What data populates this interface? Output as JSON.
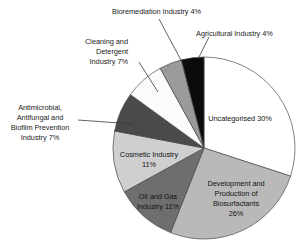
{
  "chart_data": {
    "type": "pie",
    "title": "",
    "subtitle": "",
    "xlabel": "",
    "ylabel": "",
    "legend_position": "none",
    "grid": false,
    "units": "percent",
    "start_angle_deg": 0,
    "direction": "clockwise",
    "categories": [
      "Uncategorised",
      "Development and Production of Biosurfactants",
      "Oil and Gas Industry",
      "Cosmetic Industry",
      "Antimicrobial, Antifungal and Biofilm Prevention Industry",
      "Cleaning and Detergent Industry",
      "Bioremediation Industry",
      "Agricultural Industry"
    ],
    "values": [
      30,
      26,
      11,
      11,
      7,
      7,
      4,
      4
    ],
    "colors": [
      "#ffffff",
      "#b9b9b9",
      "#6e6e6e",
      "#cfcfcf",
      "#4a4a4a",
      "#fbfbfb",
      "#9a9a9a",
      "#0b0b0b"
    ],
    "slices": [
      {
        "label": "Uncategorised 30%",
        "name": "Uncategorised",
        "value": 30,
        "color": "#ffffff",
        "label_placement": "inside"
      },
      {
        "label_line_1": "Development and",
        "label_line_2": "Production of",
        "label_line_3": "Biosurfactants",
        "label_line_4": "26%",
        "name": "Development and Production of Biosurfactants",
        "value": 26,
        "color": "#b9b9b9",
        "label_placement": "inside"
      },
      {
        "label_line_1": "Oil and Gas",
        "label_line_2": "Industry 11%",
        "name": "Oil and Gas Industry",
        "value": 11,
        "color": "#6e6e6e",
        "label_placement": "inside"
      },
      {
        "label_line_1": "Cosmetic Industry",
        "label_line_2": "11%",
        "name": "Cosmetic Industry",
        "value": 11,
        "color": "#cfcfcf",
        "label_placement": "inside"
      },
      {
        "label_line_1": "Antimicrobial,",
        "label_line_2": "Antifungal and",
        "label_line_3": "Biofilm Prevention",
        "label_line_4": "Industry 7%",
        "name": "Antimicrobial, Antifungal and Biofilm Prevention Industry",
        "value": 7,
        "color": "#4a4a4a",
        "label_placement": "outside-left"
      },
      {
        "label_line_1": "Cleaning and",
        "label_line_2": "Detergent",
        "label_line_3": "Industry 7%",
        "name": "Cleaning and Detergent Industry",
        "value": 7,
        "color": "#fbfbfb",
        "label_placement": "outside-upper-left"
      },
      {
        "label": "Bioremediation Industry 4%",
        "name": "Bioremediation Industry",
        "value": 4,
        "color": "#9a9a9a",
        "label_placement": "outside-top"
      },
      {
        "label": "Agricultural Industry 4%",
        "name": "Agricultural Industry",
        "value": 4,
        "color": "#0b0b0b",
        "label_placement": "outside-top-right"
      }
    ]
  }
}
